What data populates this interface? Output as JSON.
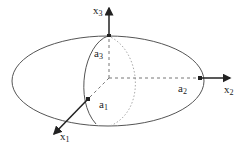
{
  "diagram": {
    "type": "ellipsoid-axes",
    "colors": {
      "stroke": "#555555",
      "axis": "#222222",
      "dotted": "#aaaaaa"
    },
    "axes": [
      {
        "name": "x1",
        "base": "x",
        "sub": "1"
      },
      {
        "name": "x2",
        "base": "x",
        "sub": "2"
      },
      {
        "name": "x3",
        "base": "x",
        "sub": "3"
      }
    ],
    "semi_axes": [
      {
        "name": "a1",
        "base": "a",
        "sub": "1"
      },
      {
        "name": "a2",
        "base": "a",
        "sub": "2"
      },
      {
        "name": "a3",
        "base": "a",
        "sub": "3"
      }
    ]
  }
}
